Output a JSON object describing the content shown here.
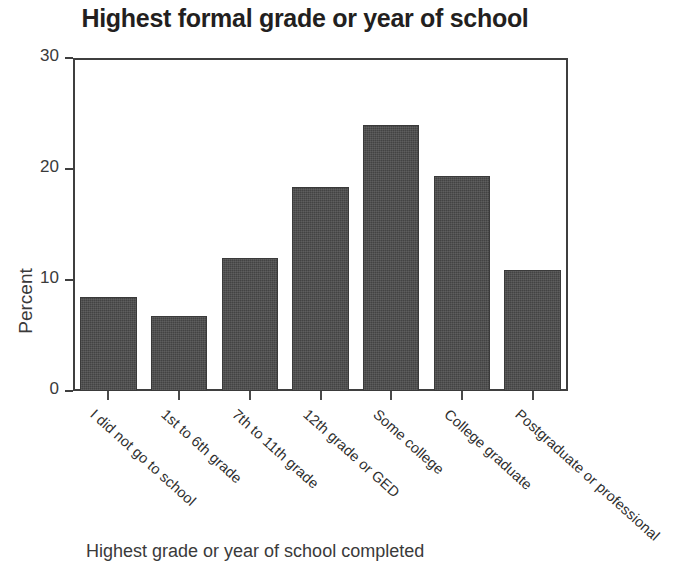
{
  "chart_data": {
    "type": "bar",
    "title": "Highest formal grade or year of school",
    "xlabel": "Highest grade or year of school completed",
    "ylabel": "Percent",
    "categories": [
      "I did not go to school",
      "1st to 6th grade",
      "7th to 11th grade",
      "12th grade or GED",
      "Some college",
      "College graduate",
      "Postgraduate or professional"
    ],
    "values": [
      8.5,
      6.8,
      12.0,
      18.4,
      24.0,
      19.4,
      10.9
    ],
    "ylim": [
      0,
      30
    ],
    "yticks": [
      0,
      10,
      20,
      30
    ],
    "ytick_labels": [
      "0",
      "10",
      "20",
      "30"
    ],
    "grid": false,
    "legend": "none",
    "bar_color": "#4b4b4b",
    "axis_color": "#3f3f3f",
    "text_color": "#231f20"
  }
}
